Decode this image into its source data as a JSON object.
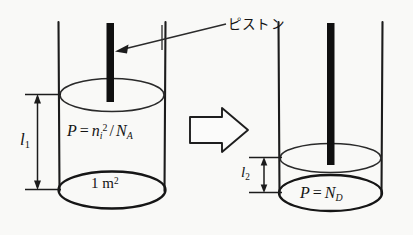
{
  "figure": {
    "background_color": "#f9f9f7",
    "ink_color": "#141414"
  },
  "annotations": {
    "piston_label": "ピストン",
    "piston_label_meaning": "piston"
  },
  "left_cylinder": {
    "name": "initial-state-cylinder",
    "height_label": "l",
    "height_subscript": "1",
    "pressure_equation": {
      "lhs": "P",
      "equals": "=",
      "rhs_base": "n",
      "rhs_sub": "i",
      "rhs_sup": "2",
      "divider": "/",
      "denominator_base": "N",
      "denominator_sub": "A",
      "full_text": "P = n_i^2 / N_A"
    },
    "area_label": {
      "value": "1",
      "unit": "m",
      "exponent": "2",
      "full_text": "1 m²"
    }
  },
  "right_cylinder": {
    "name": "final-state-cylinder",
    "height_label": "l",
    "height_subscript": "2",
    "pressure_equation": {
      "lhs": "P",
      "equals": "=",
      "rhs_base": "N",
      "rhs_sub": "D",
      "full_text": "P = N_D"
    }
  },
  "transition": {
    "arrow_name": "block-arrow-right",
    "direction": "right"
  },
  "geometry": {
    "left_wall_x": 58,
    "left_wall_x2": 165,
    "left_rod_x": 110,
    "right_wall_x": 278,
    "right_wall_x2": 382,
    "right_rod_x": 330,
    "left_piston_y": 94,
    "left_base_y": 190,
    "right_piston_y": 157,
    "right_base_y": 193
  }
}
